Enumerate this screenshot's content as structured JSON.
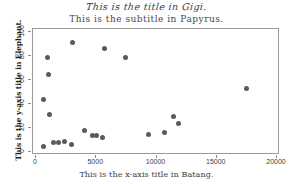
{
  "chart_data": {
    "type": "scatter",
    "title": "This is the title in Gigi.",
    "subtitle": "This is the subtitle in Papyrus.",
    "xlabel": "This is the x-axis title in Batang.",
    "ylabel": "This is the y-axis title in Elephant.",
    "xlim": [
      0,
      20000
    ],
    "ylim": [
      0,
      100
    ],
    "xticks": [
      0,
      5000,
      10000,
      15000,
      20000
    ],
    "xticklabels": [
      "0",
      "5000",
      "10000",
      "15000",
      "20000"
    ],
    "yticks": [
      0,
      20,
      40,
      60,
      80,
      100
    ],
    "yticklabels": [
      "0",
      "20",
      "40",
      "60",
      "80",
      "100"
    ],
    "grid": false,
    "legend": null,
    "marker_color": "#5a5a5a",
    "marker_size": 5,
    "points": [
      {
        "x": 600,
        "y": 44
      },
      {
        "x": 620,
        "y": 5
      },
      {
        "x": 950,
        "y": 79
      },
      {
        "x": 1000,
        "y": 65
      },
      {
        "x": 1150,
        "y": 31
      },
      {
        "x": 1450,
        "y": 8
      },
      {
        "x": 1900,
        "y": 8
      },
      {
        "x": 2350,
        "y": 9
      },
      {
        "x": 2950,
        "y": 6
      },
      {
        "x": 3050,
        "y": 91
      },
      {
        "x": 4050,
        "y": 18
      },
      {
        "x": 4700,
        "y": 14
      },
      {
        "x": 5050,
        "y": 14
      },
      {
        "x": 5550,
        "y": 12
      },
      {
        "x": 5700,
        "y": 86
      },
      {
        "x": 7450,
        "y": 79
      },
      {
        "x": 9350,
        "y": 15
      },
      {
        "x": 10650,
        "y": 16
      },
      {
        "x": 11400,
        "y": 30
      },
      {
        "x": 11850,
        "y": 24
      },
      {
        "x": 17500,
        "y": 53
      }
    ]
  }
}
